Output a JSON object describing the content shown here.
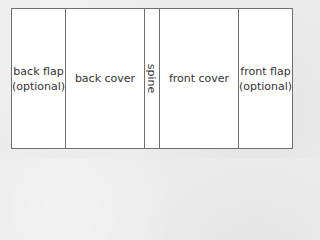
{
  "diagram": {
    "panels": [
      {
        "id": "back-flap",
        "line1": "back flap",
        "line2": "(optional)"
      },
      {
        "id": "back-cover",
        "line1": "back cover"
      },
      {
        "id": "spine",
        "line1": "spine"
      },
      {
        "id": "front-cover",
        "line1": "front cover"
      },
      {
        "id": "front-flap",
        "line1": "front flap",
        "line2": "(optional)"
      }
    ],
    "colors": {
      "background": "#ececec",
      "panel_fill": "#ffffff",
      "border": "#6f6f6f",
      "text": "#333333"
    }
  }
}
